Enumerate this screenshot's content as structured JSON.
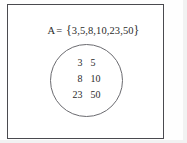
{
  "figure": {
    "caption_text": "A= {3,5,8,10,23,50}",
    "set_name": "A",
    "equals": "=",
    "open_brace": "{",
    "elements_inline": "3,5,8,10,23,50",
    "close_brace": "}",
    "circle_rows": [
      {
        "left": "3",
        "right": "5"
      },
      {
        "left": "8",
        "right": "10"
      },
      {
        "left": "23",
        "right": "50"
      }
    ],
    "elements": [
      3,
      5,
      8,
      10,
      23,
      50
    ],
    "colors": {
      "frame_border": "#4a4a4f",
      "circle_border": "#6b6b70",
      "text": "#2b2b2b",
      "background": "#ffffff"
    }
  }
}
